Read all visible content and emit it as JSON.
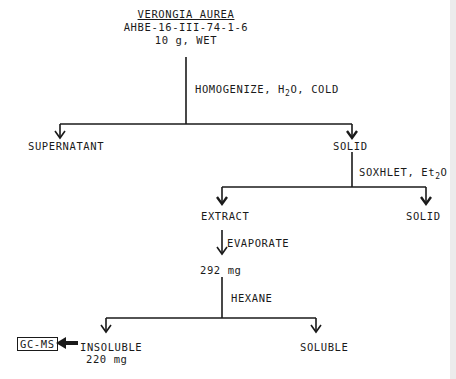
{
  "header": {
    "species": "VERONGIA AUREA",
    "specimen_id": "AHBE-16-III-74-1-6",
    "sample": "10 g, WET"
  },
  "step1": {
    "operation_prefix": "HOMOGENIZE, H",
    "operation_sub": "2",
    "operation_suffix": "O, COLD",
    "left_product": "SUPERNATANT",
    "right_product": "SOLID"
  },
  "step2": {
    "operation_prefix": "SOXHLET, Et",
    "operation_sub": "2",
    "operation_suffix": "O",
    "left_product": "EXTRACT",
    "right_product": "SOLID"
  },
  "step3": {
    "operation": "EVAPORATE",
    "product": "292 mg"
  },
  "step4": {
    "operation": "HEXANE",
    "left_product": "INSOLUBLE",
    "left_amount": "220 mg",
    "right_product": "SOLUBLE"
  },
  "analysis": {
    "label": "GC-MS"
  },
  "colors": {
    "ink": "#1a1a1a",
    "background": "#ffffff"
  }
}
